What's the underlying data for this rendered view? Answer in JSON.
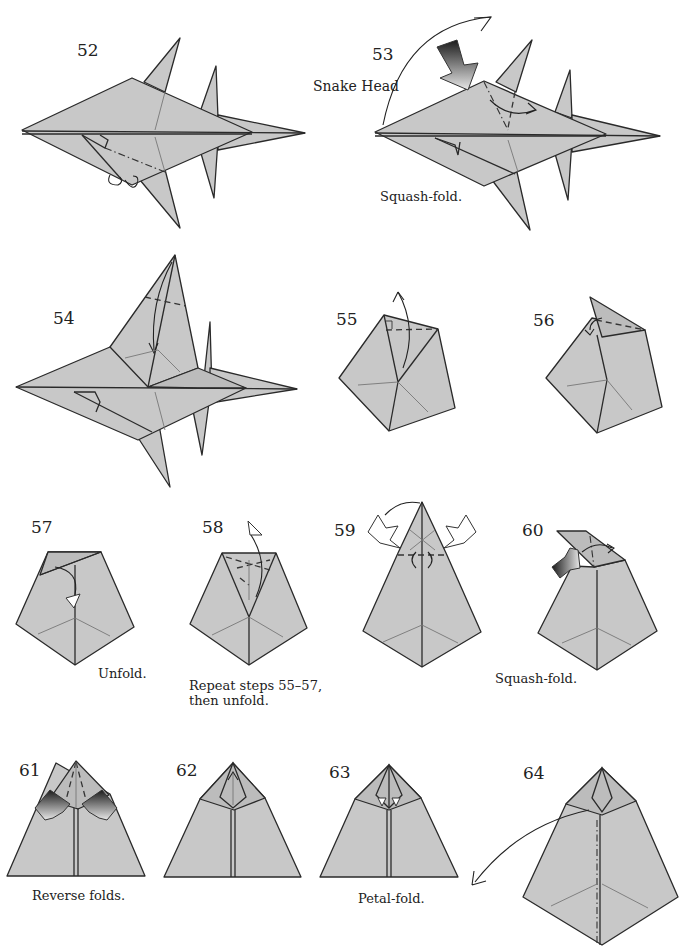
{
  "page": {
    "background": "#ffffff",
    "paper_color": "#c8c8c8",
    "line_color": "#2a2a2a"
  },
  "steps": [
    {
      "number": "52",
      "caption": "",
      "label": ""
    },
    {
      "number": "53",
      "caption": "Squash-fold.",
      "label": "Snake Head"
    },
    {
      "number": "54",
      "caption": "",
      "label": ""
    },
    {
      "number": "55",
      "caption": "",
      "label": ""
    },
    {
      "number": "56",
      "caption": "",
      "label": ""
    },
    {
      "number": "57",
      "caption": "Unfold.",
      "label": ""
    },
    {
      "number": "58",
      "caption_line1": "Repeat steps 55–57,",
      "caption_line2": "then unfold.",
      "label": ""
    },
    {
      "number": "59",
      "caption": "",
      "label": ""
    },
    {
      "number": "60",
      "caption": "Squash-fold.",
      "label": ""
    },
    {
      "number": "61",
      "caption": "Reverse folds.",
      "label": ""
    },
    {
      "number": "62",
      "caption": "",
      "label": ""
    },
    {
      "number": "63",
      "caption": "Petal-fold.",
      "label": ""
    },
    {
      "number": "64",
      "caption": "",
      "label": ""
    }
  ]
}
